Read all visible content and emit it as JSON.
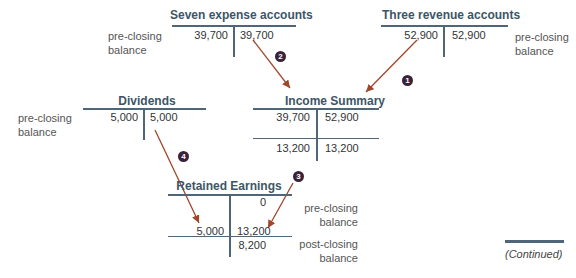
{
  "accounts": {
    "expense": {
      "title": "Seven expense accounts",
      "debit": "39,700",
      "credit": "39,700",
      "label": "pre-closing balance"
    },
    "revenue": {
      "title": "Three revenue accounts",
      "debit": "52,900",
      "credit": "52,900",
      "label": "pre-closing balance"
    },
    "dividends": {
      "title": "Dividends",
      "debit": "5,000",
      "credit": "5,000",
      "label": "pre-closing balance"
    },
    "income_summary": {
      "title": "Income Summary",
      "debit1": "39,700",
      "credit1": "52,900",
      "debit2": "13,200",
      "credit2": "13,200"
    },
    "retained_earnings": {
      "title": "Retained Earnings",
      "opening_credit": "0",
      "pre_label": "pre-closing balance",
      "debit": "5,000",
      "credit": "13,200",
      "closing_credit": "8,200",
      "post_label": "post-closing balance"
    }
  },
  "steps": [
    "1",
    "2",
    "3",
    "4"
  ],
  "footer": {
    "continued": "(Continued)"
  },
  "colors": {
    "title": "#3d5566",
    "line": "#4e6677",
    "arrow": "#a0462a",
    "badge": "#3b2238"
  }
}
